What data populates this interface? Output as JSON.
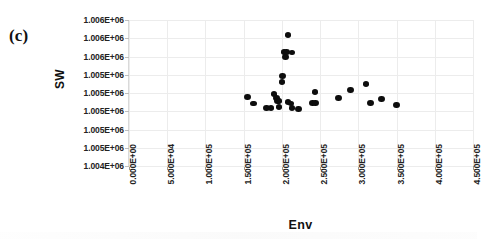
{
  "panel": {
    "label": "(c)"
  },
  "chart_data": {
    "type": "scatter",
    "title": "",
    "xlabel": "Env",
    "ylabel": "SW",
    "xlim": [
      0,
      450000
    ],
    "ylim": [
      1004000,
      1006000
    ],
    "grid": true,
    "legend": "none",
    "xticks": [
      0,
      50000,
      100000,
      150000,
      200000,
      250000,
      300000,
      350000,
      400000,
      450000
    ],
    "xtick_labels": [
      "0.000E+00",
      "5.000E+04",
      "1.000E+05",
      "1.500E+05",
      "2.000E+05",
      "2.500E+05",
      "3.000E+05",
      "3.500E+05",
      "4.000E+05",
      "4.500E+05"
    ],
    "yticks": [
      1004000,
      1004250,
      1004500,
      1004750,
      1005000,
      1005250,
      1005500,
      1005750,
      1006000
    ],
    "ytick_labels": [
      "1.004E+06",
      "1.005E+06",
      "1.005E+06",
      "1.005E+06",
      "1.005E+06",
      "1.005E+06",
      "1.006E+06",
      "1.006E+06",
      "1.006E+06"
    ],
    "series": [
      {
        "name": "SW vs Env",
        "marker": "circle",
        "color": "#0d0d0d",
        "points": [
          [
            155000,
            1004940
          ],
          [
            163000,
            1004855
          ],
          [
            180000,
            1004800
          ],
          [
            186000,
            1004800
          ],
          [
            196000,
            1004810
          ],
          [
            190000,
            1004990
          ],
          [
            193000,
            1004930
          ],
          [
            194000,
            1004895
          ],
          [
            196000,
            1004890
          ],
          [
            200000,
            1005150
          ],
          [
            201000,
            1005230
          ],
          [
            203000,
            1005560
          ],
          [
            206000,
            1005565
          ],
          [
            205000,
            1005490
          ],
          [
            213000,
            1005555
          ],
          [
            208000,
            1005790
          ],
          [
            208000,
            1004880
          ],
          [
            212000,
            1004855
          ],
          [
            213000,
            1004800
          ],
          [
            222000,
            1004785
          ],
          [
            240000,
            1004865
          ],
          [
            244000,
            1004865
          ],
          [
            243000,
            1005010
          ],
          [
            274000,
            1004930
          ],
          [
            290000,
            1005045
          ],
          [
            310000,
            1005125
          ],
          [
            316000,
            1004860
          ],
          [
            330000,
            1004915
          ],
          [
            350000,
            1004835
          ]
        ]
      }
    ]
  }
}
